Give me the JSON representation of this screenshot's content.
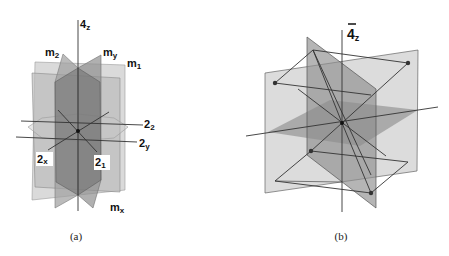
{
  "figure": {
    "panel_a": {
      "caption": "(a)",
      "axis_labels": {
        "four_z": {
          "main": "4",
          "sub": "z"
        },
        "m2": {
          "main": "m",
          "sub": "2"
        },
        "my": {
          "main": "m",
          "sub": "y"
        },
        "m1": {
          "main": "m",
          "sub": "1"
        },
        "two_2": {
          "main": "2",
          "sub": "2"
        },
        "two_y": {
          "main": "2",
          "sub": "y"
        },
        "two_x": {
          "main": "2",
          "sub": "x"
        },
        "two_1": {
          "main": "2",
          "sub": "1"
        },
        "mx": {
          "main": "m",
          "sub": "x"
        }
      }
    },
    "panel_b": {
      "caption": "(b)",
      "axis_label": {
        "main": "4",
        "sub": "z",
        "overbar": true
      }
    },
    "colors": {
      "plane_light": "#d6d6d6",
      "plane_mid": "#a8a8a8",
      "plane_dark": "#7d7d7d",
      "line": "#333333"
    }
  }
}
